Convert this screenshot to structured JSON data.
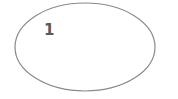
{
  "diagram": {
    "nodes": [
      {
        "id": "node-1",
        "shape": "ellipse",
        "label": "1",
        "cx": 85,
        "cy": 47,
        "rx": 70,
        "ry": 44,
        "stroke": "#8a8a8a",
        "fill": "#ffffff",
        "label_color": "#5a5a5a"
      }
    ]
  }
}
